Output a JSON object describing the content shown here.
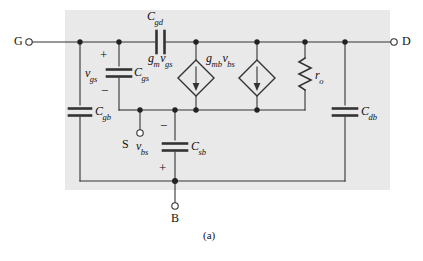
{
  "figure": {
    "caption": "(a)",
    "background_color": "#e9e9e9",
    "line_color": "#333333",
    "text_color": "#111111"
  },
  "terminals": [
    {
      "id": "gate",
      "label": "G",
      "x": 18,
      "y": 36
    },
    {
      "id": "drain",
      "label": "D",
      "x": 398,
      "y": 36
    },
    {
      "id": "source",
      "label": "S",
      "x": 122,
      "y": 143
    },
    {
      "id": "bulk",
      "label": "B",
      "x": 170,
      "y": 219
    }
  ],
  "components": [
    {
      "id": "c-gd",
      "symbol": "C",
      "sub": "gd",
      "type": "capacitor",
      "orientation": "horizontal-series",
      "label_x": 150,
      "label_y": 14
    },
    {
      "id": "c-gs",
      "symbol": "C",
      "sub": "gs",
      "type": "capacitor",
      "orientation": "vertical-series",
      "label_x": 127,
      "label_y": 73
    },
    {
      "id": "c-gb",
      "symbol": "C",
      "sub": "gb",
      "type": "capacitor",
      "orientation": "vertical-series",
      "label_x": 91,
      "label_y": 115
    },
    {
      "id": "c-sb",
      "symbol": "C",
      "sub": "sb",
      "type": "capacitor",
      "orientation": "vertical-series",
      "label_x": 188,
      "label_y": 146
    },
    {
      "id": "c-db",
      "symbol": "C",
      "sub": "db",
      "type": "capacitor",
      "orientation": "vertical-series",
      "label_x": 357,
      "label_y": 115
    },
    {
      "id": "r-o",
      "symbol": "r",
      "sub": "o",
      "type": "resistor",
      "orientation": "vertical",
      "label_x": 317,
      "label_y": 74
    }
  ],
  "voltages": [
    {
      "id": "v-gs",
      "symbol": "v",
      "sub": "gs",
      "label_x": 88,
      "label_y": 73,
      "plus_x": 101,
      "plus_y": 44,
      "minus_x": 103,
      "minus_y": 99
    },
    {
      "id": "v-bs",
      "symbol": "v",
      "sub": "bs",
      "label_x": 137,
      "label_y": 146,
      "plus_x": 172,
      "plus_y": 165,
      "minus_x": 166,
      "minus_y": 126
    }
  ],
  "sources": [
    {
      "id": "gm-vgs",
      "gain": "g",
      "gain_sub": "m",
      "ctrl": "v",
      "ctrl_sub": "gs",
      "type": "dependent-current-source",
      "label_x": 158,
      "label_y": 58
    },
    {
      "id": "gmb-vbs",
      "gain": "g",
      "gain_sub": "mb",
      "ctrl": "v",
      "ctrl_sub": "bs",
      "type": "dependent-current-source",
      "label_x": 213,
      "label_y": 58
    }
  ],
  "nodes": [
    {
      "id": "node-gate-left",
      "x": 80,
      "y": 42
    },
    {
      "id": "node-gate-right",
      "x": 119,
      "y": 42
    },
    {
      "id": "node-drain-a",
      "x": 196,
      "y": 42
    },
    {
      "id": "node-drain-b",
      "x": 257,
      "y": 42
    },
    {
      "id": "node-drain-c",
      "x": 305,
      "y": 42
    },
    {
      "id": "node-drain-d",
      "x": 345,
      "y": 42
    },
    {
      "id": "node-src-a",
      "x": 140,
      "y": 110
    },
    {
      "id": "node-src-b",
      "x": 175,
      "y": 110
    },
    {
      "id": "node-src-c",
      "x": 196,
      "y": 110
    },
    {
      "id": "node-src-d",
      "x": 257,
      "y": 110
    },
    {
      "id": "node-bulk-rail",
      "x": 175,
      "y": 181
    }
  ]
}
